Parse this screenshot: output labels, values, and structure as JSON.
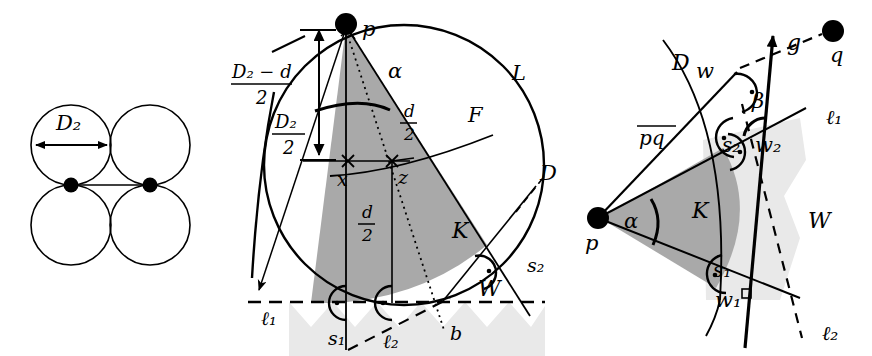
{
  "figure": {
    "type": "geometry-diagram",
    "panels": [
      {
        "id": "left",
        "name": "four-circles-packing",
        "labels": {
          "diameter": "D₂"
        },
        "circles": [
          {
            "cx": 71,
            "cy": 145,
            "r": 40
          },
          {
            "cx": 150,
            "cy": 145,
            "r": 40
          },
          {
            "cx": 71,
            "cy": 225,
            "r": 40
          },
          {
            "cx": 150,
            "cy": 225,
            "r": 40
          }
        ],
        "points": [
          {
            "name": "left-node",
            "x": 71,
            "y": 185
          },
          {
            "name": "right-node",
            "x": 150,
            "y": 185
          }
        ],
        "arrow": {
          "x1": 33,
          "y1": 145,
          "x2": 110,
          "y2": 145
        }
      },
      {
        "id": "middle",
        "name": "disk-and-wedge-construction",
        "labels": {
          "p": "p",
          "x": "x",
          "z": "z",
          "alpha": "α",
          "L": "L",
          "F": "F",
          "D": "D",
          "K": "K",
          "W": "W",
          "b": "b",
          "s1": "s₁",
          "s2": "s₂",
          "l1": "ℓ₁",
          "l2": "ℓ₂",
          "frac_d_2_upper": {
            "num": "d",
            "den": "2"
          },
          "frac_d_2_lower": {
            "num": "d",
            "den": "2"
          },
          "frac_D2_minus_d_2": {
            "num": "D₂ − d",
            "den": "2"
          },
          "frac_D2_2": {
            "num": "D₂",
            "den": "2"
          }
        }
      },
      {
        "id": "right",
        "name": "cone-and-halfplane-construction",
        "labels": {
          "p": "p",
          "q": "q",
          "g": "g",
          "w": "w",
          "w1": "w₁",
          "w2": "w₂",
          "alpha": "α",
          "beta": "β",
          "D": "D",
          "K": "K",
          "W": "W",
          "pq": "pq",
          "s1": "s₁",
          "s2": "s₂",
          "l1": "ℓ₁",
          "l2": "ℓ₂"
        }
      }
    ],
    "colors": {
      "ink": "#000000",
      "cone_fill": "#a9a9a9",
      "wedge_fill": "#e9e9e9",
      "background": "#ffffff"
    }
  }
}
